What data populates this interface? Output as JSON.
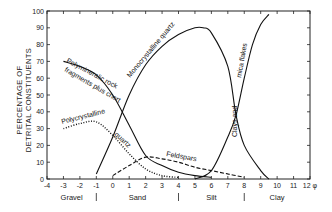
{
  "chart_data": {
    "type": "line",
    "title": "",
    "xlabel": "φ",
    "ylabel": "PERCENTAGE OF DETRITAL CONSTITUENTS",
    "ylabel_lines": [
      "PERCENTAGE OF",
      "DETRITAL CONSTITUENTS"
    ],
    "xlim": [
      -4,
      12
    ],
    "ylim": [
      0,
      100
    ],
    "x_ticks": [
      -4,
      -3,
      -2,
      -1,
      0,
      1,
      2,
      3,
      4,
      5,
      6,
      7,
      8,
      9,
      10,
      11,
      12
    ],
    "x_tick_labels": [
      "-4",
      "-3",
      "-2",
      "-1",
      "0",
      "1",
      "2",
      "3",
      "4",
      "5",
      "6",
      "7",
      "8",
      "9",
      "10",
      "11",
      "12 φ"
    ],
    "y_ticks": [
      0,
      10,
      20,
      30,
      40,
      50,
      60,
      70,
      80,
      90,
      100
    ],
    "y_tick_labels": [
      "0",
      "10",
      "20",
      "30",
      "40",
      "50",
      "60",
      "70",
      "80",
      "90",
      "100"
    ],
    "grid": false,
    "size_classes": [
      {
        "label": "Gravel",
        "center": -2.5
      },
      {
        "label": "Sand",
        "center": 1.5
      },
      {
        "label": "Silt",
        "center": 6
      },
      {
        "label": "Clay",
        "center": 10
      }
    ],
    "class_boundaries": [
      -1,
      4,
      8
    ],
    "series": [
      {
        "name": "Polymineralic rock fragments plus chert",
        "label_lines": [
          "Polymineralic rock",
          "fragments plus chert"
        ],
        "style": "solid",
        "x": [
          -3,
          -2,
          -1,
          0,
          1,
          2,
          3,
          4,
          5,
          6
        ],
        "y": [
          70,
          67,
          62,
          50,
          32,
          14,
          8,
          4,
          2,
          1
        ]
      },
      {
        "name": "Monocrystalline quartz",
        "style": "solid",
        "x": [
          -1,
          0,
          1,
          2,
          3,
          4,
          5,
          5.5,
          6,
          7,
          7.5,
          8,
          9,
          9.5
        ],
        "y": [
          3,
          25,
          50,
          68,
          79,
          86,
          90,
          90,
          87,
          67,
          38,
          20,
          5,
          0
        ]
      },
      {
        "name": "Polycrystalline quartz",
        "label_lines": [
          "Polycrystalline",
          "quartz"
        ],
        "style": "dotted",
        "x": [
          -3,
          -2,
          -1,
          0,
          1,
          2,
          3,
          4
        ],
        "y": [
          30,
          33,
          34,
          26,
          15,
          6,
          2,
          1
        ]
      },
      {
        "name": "Feldspars",
        "style": "dashed",
        "x": [
          0,
          1,
          2,
          3,
          4,
          5,
          6,
          7,
          8
        ],
        "y": [
          2,
          8,
          13,
          12,
          10,
          7,
          5,
          3,
          1
        ]
      },
      {
        "name": "Clays and mica flakes",
        "label_lines": [
          "Clays and",
          "mica flakes"
        ],
        "style": "solid",
        "x": [
          5,
          6,
          7,
          7.5,
          8,
          8.5,
          9,
          9.5
        ],
        "y": [
          0,
          5,
          25,
          38,
          60,
          80,
          92,
          98
        ]
      }
    ]
  }
}
